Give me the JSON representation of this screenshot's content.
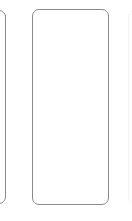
{
  "carousel": {
    "border_color": "#8a8a8a",
    "background": "#ffffff",
    "cards": [
      {
        "position": "left",
        "state": "partially-visible",
        "content": ""
      },
      {
        "position": "center",
        "state": "focused",
        "content": ""
      },
      {
        "position": "right",
        "state": "faint-edge",
        "content": ""
      }
    ]
  }
}
